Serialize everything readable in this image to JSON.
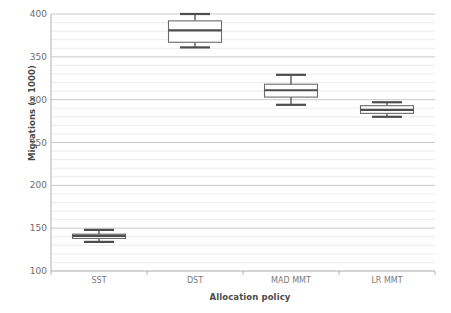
{
  "chart_data": {
    "type": "box",
    "title": "",
    "xlabel": "Allocation policy",
    "ylabel": "Migrations (x 1000)",
    "categories": [
      "SST",
      "DST",
      "MAD MMT",
      "LR MMT"
    ],
    "ylim": [
      100,
      400
    ],
    "yticks": [
      100,
      150,
      200,
      250,
      300,
      350,
      400
    ],
    "ytick_labels": [
      "100",
      "150",
      "200",
      "250",
      "300",
      "350",
      "400"
    ],
    "minor_tick_step": 10,
    "grid": "horizontal",
    "legend": "none",
    "box_color": "#ffffff",
    "line_color": "#4d4d4d",
    "grid_major_color": "#c9c9c9",
    "grid_minor_color": "#ececec",
    "boxes": [
      {
        "category": "SST",
        "min": 134,
        "q1": 138,
        "median": 141,
        "q3": 143,
        "max": 148
      },
      {
        "category": "DST",
        "min": 361,
        "q1": 367,
        "median": 381,
        "q3": 392,
        "max": 400
      },
      {
        "category": "MAD MMT",
        "min": 294,
        "q1": 303,
        "median": 311,
        "q3": 318,
        "max": 329
      },
      {
        "category": "LR MMT",
        "min": 280,
        "q1": 284,
        "median": 288,
        "q3": 293,
        "max": 297
      }
    ]
  }
}
